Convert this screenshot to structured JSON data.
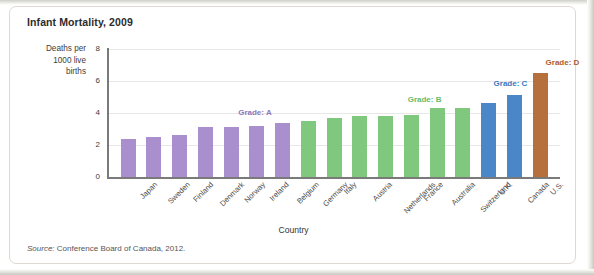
{
  "figure": {
    "title": "Infant Mortality, 2009",
    "source_prefix": "Source:",
    "source_text": " Conference Board of Canada, 2012."
  },
  "chart_data": {
    "type": "bar",
    "title": "Infant Mortality, 2009",
    "xlabel": "Country",
    "ylabel": "Deaths per 1000 live births",
    "ylabel_lines": [
      "Deaths per",
      "1000 live",
      "births"
    ],
    "ylim": [
      0,
      8
    ],
    "yticks": [
      0,
      2,
      4,
      6,
      8
    ],
    "ytick_labels": [
      "0",
      "2",
      "4",
      "6",
      "8"
    ],
    "grid": true,
    "legend": "none",
    "categories": [
      "Japan",
      "Sweden",
      "Finland",
      "Denmark",
      "Norway",
      "Ireland",
      "Belgium",
      "Germany",
      "Italy",
      "Austria",
      "Netherlands",
      "France",
      "Australia",
      "Switzerland",
      "U.K.",
      "Canada",
      "U.S."
    ],
    "values": [
      2.4,
      2.5,
      2.6,
      3.1,
      3.1,
      3.2,
      3.4,
      3.5,
      3.7,
      3.8,
      3.8,
      3.9,
      4.3,
      4.3,
      4.6,
      5.1,
      6.5
    ],
    "bar_colors": [
      "#a98fce",
      "#a98fce",
      "#a98fce",
      "#a98fce",
      "#a98fce",
      "#a98fce",
      "#a98fce",
      "#81c87f",
      "#81c87f",
      "#81c87f",
      "#81c87f",
      "#81c87f",
      "#81c87f",
      "#81c87f",
      "#4a86c8",
      "#4a86c8",
      "#b5703c"
    ],
    "annotations": [
      {
        "text": "Grade: A",
        "color": "#8f77bb",
        "x_pct": 35.0,
        "y_value": 3.95
      },
      {
        "text": "Grade: B",
        "color": "#6aba68",
        "x_pct": 72.5,
        "y_value": 4.75
      },
      {
        "text": "Grade: C",
        "color": "#3a78bd",
        "x_pct": 91.5,
        "y_value": 5.75
      },
      {
        "text": "Grade: D",
        "color": "#a9602e",
        "x_pct": 103.0,
        "y_value": 7.05
      }
    ]
  }
}
